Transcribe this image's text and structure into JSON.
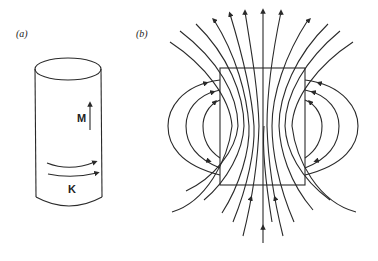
{
  "panel_a": {
    "label": "(a)",
    "magnetization_label": "M",
    "surface_current_label": "K"
  },
  "panel_b": {
    "label": "(b)"
  },
  "colors": {
    "line": "#2a2a2a",
    "background": "#ffffff"
  }
}
